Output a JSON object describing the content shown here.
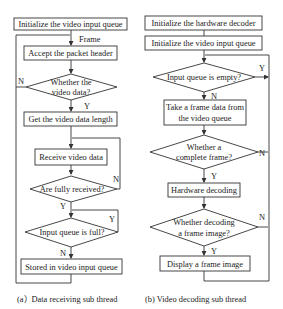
{
  "flowcharts": [
    {
      "id": "a",
      "caption": "(a）Data receiving sub thread",
      "nodes": {
        "init_queue": "Initialize the video input queue",
        "frame_label": "Frame",
        "accept_header": "Accept the packet header",
        "is_video_1": "Whether the",
        "is_video_2": "video data?",
        "get_length": "Get the video data length",
        "receive_data": "Receive video data",
        "fully_received": "Are fully received?",
        "queue_full": "Input queue is full?",
        "store_queue": "Stored in video input queue"
      },
      "edge_labels": {
        "is_video_no": "N",
        "is_video_yes": "Y",
        "fully_received_no": "N",
        "fully_received_yes": "Y",
        "queue_full_yes": "Y",
        "queue_full_no": "N"
      }
    },
    {
      "id": "b",
      "caption": "(b) Video decoding sub thread",
      "nodes": {
        "init_decoder": "Initialize the hardware decoder",
        "init_queue": "Initialize the video input queue",
        "queue_empty": "Input queue is empty?",
        "take_frame_1": "Take a frame data from",
        "take_frame_2": "the video queue",
        "complete_frame_1": "Whether a",
        "complete_frame_2": "complete frame?",
        "hw_decoding": "Hardware decoding",
        "decoded_image_1": "Whether decoding",
        "decoded_image_2": "a frame image?",
        "display_image": "Display a frame image"
      },
      "edge_labels": {
        "queue_empty_yes": "Y",
        "queue_empty_no": "N",
        "complete_frame_no": "N",
        "complete_frame_yes": "Y",
        "decoded_image_no": "N",
        "decoded_image_yes": "Y"
      }
    }
  ]
}
